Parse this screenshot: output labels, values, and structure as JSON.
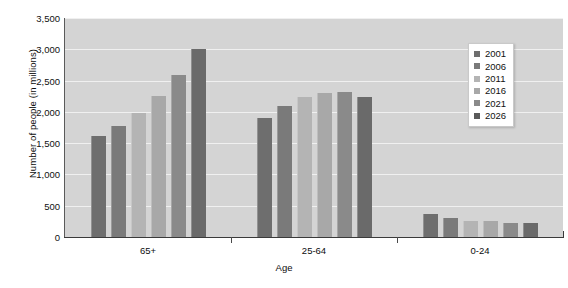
{
  "chart_data": {
    "type": "bar",
    "title": "",
    "subtitle": "",
    "xlabel": "Age",
    "ylabel": "Number of people (in millions)",
    "categories": [
      "65+",
      "25-64",
      "0-24"
    ],
    "ylim": [
      0,
      3500
    ],
    "ytick_values": [
      0,
      500,
      1000,
      1500,
      2000,
      2500,
      3000,
      3500
    ],
    "ytick_labels": [
      "0",
      "500",
      "1,000",
      "1,500",
      "2,000",
      "2,500",
      "3,000",
      "3,500"
    ],
    "grid": true,
    "grid_axis": "y",
    "legend_position": "top-right",
    "orientation": "vertical",
    "series": [
      {
        "name": "2001",
        "color": "#6e6e6e",
        "values": [
          1620,
          1900,
          370
        ]
      },
      {
        "name": "2006",
        "color": "#7a7a7a",
        "values": [
          1780,
          2090,
          300
        ]
      },
      {
        "name": "2011",
        "color": "#b4b4b4",
        "values": [
          1980,
          2230,
          250
        ]
      },
      {
        "name": "2016",
        "color": "#a8a8a8",
        "values": [
          2250,
          2300,
          250
        ]
      },
      {
        "name": "2021",
        "color": "#8a8a8a",
        "values": [
          2590,
          2310,
          230
        ]
      },
      {
        "name": "2026",
        "color": "#6a6a6a",
        "values": [
          3000,
          2240,
          220
        ]
      }
    ]
  },
  "legend": {
    "items": [
      {
        "label": "2001",
        "swatch": "#6e6e6e"
      },
      {
        "label": "2006",
        "swatch": "#7a7a7a"
      },
      {
        "label": "2011",
        "swatch": "#b4b4b4"
      },
      {
        "label": "2016",
        "swatch": "#a8a8a8"
      },
      {
        "label": "2021",
        "swatch": "#8a8a8a"
      },
      {
        "label": "2026",
        "swatch": "#5a5a5a"
      }
    ]
  },
  "axes": {
    "y_title": "Number of people (in millions)",
    "x_title": "Age"
  },
  "colors": {
    "plot_background": "#d4d4d4",
    "page_background": "#ffffff",
    "gridline": "#f0f0f0",
    "axis_line": "#3a3a3a",
    "text": "#0d0d0d"
  }
}
